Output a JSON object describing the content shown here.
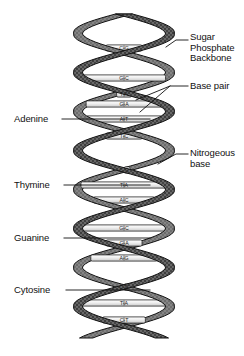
{
  "figure": {
    "background_color": "#ffffff",
    "ink_color": "#111111",
    "ribbon_fill": "#7d7d7d",
    "ribbon_stroke": "#1a1a1a",
    "rung_fill": "#f2f2f2",
    "rung_stroke": "#262626",
    "rung_label_color": "#1a1a1a"
  },
  "labels": {
    "left": [
      {
        "id": "adenine",
        "text": "Adenine",
        "x": 14,
        "y": 114,
        "leader_from_x": 62,
        "leader_to_x": 150,
        "leader_y": 119
      },
      {
        "id": "thymine",
        "text": "Thymine",
        "x": 14,
        "y": 180,
        "leader_from_x": 64,
        "leader_to_x": 150,
        "leader_y": 185
      },
      {
        "id": "guanine",
        "text": "Guanine",
        "x": 14,
        "y": 233,
        "leader_from_x": 64,
        "leader_to_x": 150,
        "leader_y": 238
      },
      {
        "id": "cytosine",
        "text": "Cytosine",
        "x": 14,
        "y": 285,
        "leader_from_x": 66,
        "leader_to_x": 150,
        "leader_y": 290
      }
    ],
    "right": [
      {
        "id": "sugar-phosphate-backbone",
        "lines": [
          "Sugar",
          "Phosphate",
          "Backbone"
        ],
        "text": "Sugar\nPhosphate\nBackbone",
        "x": 190,
        "y": 32
      },
      {
        "id": "base-pair",
        "lines": [
          "Base pair"
        ],
        "text": "Base pair",
        "x": 190,
        "y": 81
      },
      {
        "id": "nitrogeous-base",
        "lines": [
          "Nitrogeous",
          "base"
        ],
        "text": "Nitrogeous\nbase",
        "x": 190,
        "y": 148
      }
    ]
  },
  "chart_data": {
    "type": "diagram",
    "helix": {
      "center_x": 124,
      "top_y": 14,
      "bottom_y": 338,
      "amplitude": 46,
      "period": 78,
      "strand_count": 2,
      "strand_phase_offset": 0.5,
      "ribbon_width": 13
    },
    "base_pairs": [
      {
        "index": 0,
        "y": 48,
        "left": "C",
        "right": "G",
        "pair_text": "C-G"
      },
      {
        "index": 1,
        "y": 78,
        "left": "G",
        "right": "C",
        "pair_text": "G-C"
      },
      {
        "index": 2,
        "y": 94,
        "left": "T",
        "right": "A",
        "pair_text": "T-A"
      },
      {
        "index": 3,
        "y": 104,
        "left": "G",
        "right": "A",
        "pair_text": "G-A"
      },
      {
        "index": 4,
        "y": 119,
        "left": "A",
        "right": "T",
        "pair_text": "A-T"
      },
      {
        "index": 5,
        "y": 136,
        "left": "T",
        "right": "C",
        "pair_text": "T-C"
      },
      {
        "index": 6,
        "y": 170,
        "left": "C",
        "right": "G",
        "pair_text": "C-G"
      },
      {
        "index": 7,
        "y": 185,
        "left": "T",
        "right": "A",
        "pair_text": "T-A"
      },
      {
        "index": 8,
        "y": 200,
        "left": "A",
        "right": "C",
        "pair_text": "A-C"
      },
      {
        "index": 9,
        "y": 228,
        "left": "G",
        "right": "C",
        "pair_text": "G-C"
      },
      {
        "index": 10,
        "y": 243,
        "left": "G",
        "right": "A",
        "pair_text": "G-A"
      },
      {
        "index": 11,
        "y": 258,
        "left": "A",
        "right": "G",
        "pair_text": "A-G"
      },
      {
        "index": 12,
        "y": 287,
        "left": "C",
        "right": "G",
        "pair_text": "C-G"
      },
      {
        "index": 13,
        "y": 303,
        "left": "T",
        "right": "A",
        "pair_text": "T-A"
      },
      {
        "index": 14,
        "y": 320,
        "left": "C",
        "right": "T",
        "pair_text": "C-T"
      }
    ],
    "annotations": [
      "Sugar Phosphate Backbone",
      "Base pair",
      "Nitrogeous base",
      "Adenine",
      "Thymine",
      "Guanine",
      "Cytosine"
    ]
  }
}
